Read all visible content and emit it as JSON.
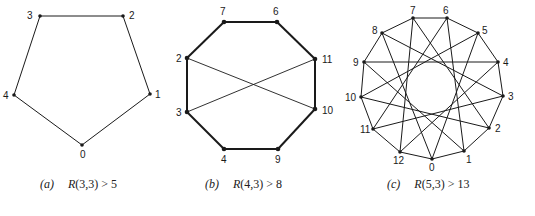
{
  "figures": [
    {
      "id": "a",
      "caption_tag": "(a)",
      "caption_R": "R",
      "caption_rest": "(3,3) > 5",
      "nodes": [
        {
          "label": "0",
          "x": 82,
          "y": 145,
          "lx": 80,
          "ly": 158
        },
        {
          "label": "1",
          "x": 150,
          "y": 94,
          "lx": 155,
          "ly": 98
        },
        {
          "label": "2",
          "x": 123,
          "y": 16,
          "lx": 129,
          "ly": 19
        },
        {
          "label": "3",
          "x": 40,
          "y": 16,
          "lx": 27,
          "ly": 19
        },
        {
          "label": "4",
          "x": 14,
          "y": 95,
          "lx": 3,
          "ly": 99
        }
      ],
      "edges": [
        [
          0,
          1
        ],
        [
          1,
          2
        ],
        [
          2,
          3
        ],
        [
          3,
          4
        ],
        [
          4,
          0
        ]
      ],
      "stroke_width": 1
    },
    {
      "id": "b",
      "caption_tag": "(b)",
      "caption_R": "R",
      "caption_rest": "(4,3) > 8",
      "nodes": [
        {
          "label": "7",
          "x": 224,
          "y": 22,
          "lx": 220,
          "ly": 15
        },
        {
          "label": "6",
          "x": 277,
          "y": 22,
          "lx": 273,
          "ly": 15
        },
        {
          "label": "11",
          "x": 315,
          "y": 59,
          "lx": 322,
          "ly": 63
        },
        {
          "label": "10",
          "x": 315,
          "y": 109,
          "lx": 322,
          "ly": 114
        },
        {
          "label": "9",
          "x": 278,
          "y": 149,
          "lx": 275,
          "ly": 163
        },
        {
          "label": "4",
          "x": 224,
          "y": 149,
          "lx": 221,
          "ly": 163
        },
        {
          "label": "3",
          "x": 187,
          "y": 112,
          "lx": 176,
          "ly": 116
        },
        {
          "label": "2",
          "x": 187,
          "y": 58,
          "lx": 176,
          "ly": 62
        }
      ],
      "edges": [
        [
          0,
          1
        ],
        [
          1,
          2
        ],
        [
          2,
          3
        ],
        [
          3,
          4
        ],
        [
          4,
          5
        ],
        [
          5,
          6
        ],
        [
          6,
          7
        ],
        [
          7,
          0
        ],
        [
          7,
          3
        ],
        [
          6,
          2
        ]
      ],
      "thick_edges": [
        [
          0,
          1
        ],
        [
          1,
          2
        ],
        [
          2,
          3
        ],
        [
          3,
          4
        ],
        [
          4,
          5
        ],
        [
          5,
          6
        ],
        [
          6,
          7
        ],
        [
          7,
          0
        ]
      ],
      "stroke_width": 2
    },
    {
      "id": "c",
      "caption_tag": "(c)",
      "caption_R": "R",
      "caption_rest": "(5,3) > 13",
      "nodes": [
        {
          "label": "0",
          "x": 432,
          "y": 159,
          "lx": 429,
          "ly": 171
        },
        {
          "label": "1",
          "x": 464,
          "y": 151,
          "lx": 466,
          "ly": 163
        },
        {
          "label": "2",
          "x": 489,
          "y": 128,
          "lx": 495,
          "ly": 132
        },
        {
          "label": "3",
          "x": 503,
          "y": 96,
          "lx": 508,
          "ly": 100
        },
        {
          "label": "4",
          "x": 498,
          "y": 62,
          "lx": 503,
          "ly": 66
        },
        {
          "label": "5",
          "x": 478,
          "y": 33,
          "lx": 482,
          "ly": 34
        },
        {
          "label": "6",
          "x": 447,
          "y": 18,
          "lx": 443,
          "ly": 14
        },
        {
          "label": "7",
          "x": 413,
          "y": 18,
          "lx": 410,
          "ly": 14
        },
        {
          "label": "8",
          "x": 382,
          "y": 33,
          "lx": 372,
          "ly": 34
        },
        {
          "label": "9",
          "x": 364,
          "y": 62,
          "lx": 353,
          "ly": 66
        },
        {
          "label": "10",
          "x": 361,
          "y": 97,
          "lx": 345,
          "ly": 101
        },
        {
          "label": "11",
          "x": 373,
          "y": 129,
          "lx": 360,
          "ly": 133
        },
        {
          "label": "12",
          "x": 400,
          "y": 152,
          "lx": 393,
          "ly": 164
        }
      ],
      "edges_rule": "circulant C13 with offsets 1 and 5",
      "edges": [
        [
          0,
          1
        ],
        [
          1,
          2
        ],
        [
          2,
          3
        ],
        [
          3,
          4
        ],
        [
          4,
          5
        ],
        [
          5,
          6
        ],
        [
          6,
          7
        ],
        [
          7,
          8
        ],
        [
          8,
          9
        ],
        [
          9,
          10
        ],
        [
          10,
          11
        ],
        [
          11,
          12
        ],
        [
          12,
          0
        ],
        [
          0,
          5
        ],
        [
          1,
          6
        ],
        [
          2,
          7
        ],
        [
          3,
          8
        ],
        [
          4,
          9
        ],
        [
          5,
          10
        ],
        [
          6,
          11
        ],
        [
          7,
          12
        ],
        [
          8,
          0
        ],
        [
          9,
          1
        ],
        [
          10,
          2
        ],
        [
          11,
          3
        ],
        [
          12,
          4
        ]
      ],
      "stroke_width": 1
    }
  ],
  "colors": {
    "ink": "#1a1a1a",
    "background": "#ffffff"
  }
}
